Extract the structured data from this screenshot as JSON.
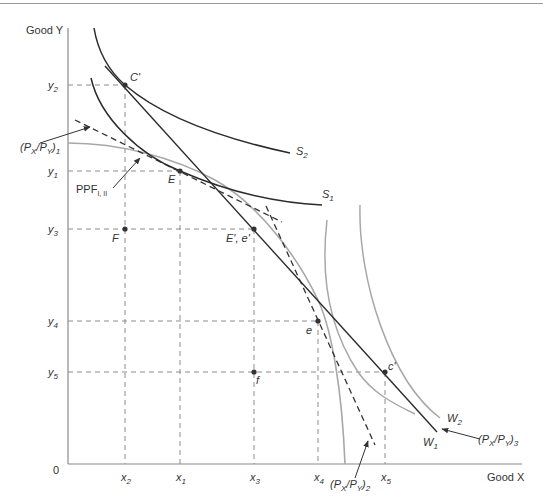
{
  "axes": {
    "y_label": "Good Y",
    "x_label": "Good X",
    "origin": "0"
  },
  "y_ticks": [
    {
      "name": "y2",
      "base": "y",
      "sub": "2"
    },
    {
      "name": "y1",
      "base": "y",
      "sub": "1"
    },
    {
      "name": "y3",
      "base": "y",
      "sub": "3"
    },
    {
      "name": "y4",
      "base": "y",
      "sub": "4"
    },
    {
      "name": "y5",
      "base": "y",
      "sub": "5"
    }
  ],
  "x_ticks": [
    {
      "name": "x2",
      "base": "x",
      "sub": "2"
    },
    {
      "name": "x1",
      "base": "x",
      "sub": "1"
    },
    {
      "name": "x3",
      "base": "x",
      "sub": "3"
    },
    {
      "name": "x4",
      "base": "x",
      "sub": "4"
    },
    {
      "name": "x5",
      "base": "x",
      "sub": "5"
    }
  ],
  "points": {
    "C_prime": "C'",
    "E": "E",
    "E_prime_e_prime": "E', e'",
    "F": "F",
    "e": "e",
    "f": "f",
    "c_prime": "c'"
  },
  "curves": {
    "S2": {
      "base": "S",
      "sub": "2"
    },
    "S1": {
      "base": "S",
      "sub": "1"
    },
    "W2": {
      "base": "W",
      "sub": "2"
    },
    "W1": {
      "base": "W",
      "sub": "1"
    },
    "PPF": {
      "base": "PPF",
      "sub": "I, II"
    }
  },
  "price_lines": {
    "p1": {
      "open": "(P",
      "x": "X",
      "slash": "/P",
      "y": "Y",
      "close": ")",
      "sub": "1"
    },
    "p2": {
      "open": "(P",
      "x": "X",
      "slash": "/P",
      "y": "Y",
      "close": ")",
      "sub": "2"
    },
    "p3": {
      "open": "(P",
      "x": "X",
      "slash": "/P",
      "y": "Y",
      "close": ")",
      "sub": "3"
    }
  },
  "colors": {
    "axis": "#8a8a8a",
    "dark_curve": "#2b2b2b",
    "light_curve": "#a8a8a8",
    "guide": "#8c8c8c"
  }
}
